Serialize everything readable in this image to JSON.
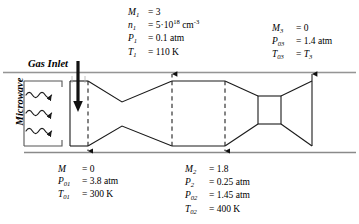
{
  "diagram": {
    "stroke_color": "#1a1a1a",
    "rail_color": "#7a7a7a",
    "dash_color": "#2b2b2b"
  },
  "labels": {
    "gas_inlet": "Gas Inlet",
    "microwave": "Microwave"
  },
  "stations": {
    "top_center": {
      "name": "station-1-conditions",
      "rows": [
        {
          "symbol": "M",
          "sub": "1",
          "sup": "",
          "eq": "=",
          "value": "3",
          "unit": ""
        },
        {
          "symbol": "n",
          "sub": "1",
          "sup": "",
          "eq": "=",
          "value": "5·10",
          "unit": "cm",
          "value_sup": "18",
          "unit_sup": "-3"
        },
        {
          "symbol": "P",
          "sub": "1",
          "sup": "",
          "eq": "=",
          "value": "0.1",
          "unit": "atm"
        },
        {
          "symbol": "T",
          "sub": "1",
          "sup": "",
          "eq": "=",
          "value": "110",
          "unit": "K"
        }
      ]
    },
    "top_right": {
      "name": "station-3-conditions",
      "rows": [
        {
          "symbol": "M",
          "sub": "3",
          "eq": "=",
          "value": "0",
          "unit": ""
        },
        {
          "symbol": "P",
          "sub": "03",
          "eq": "=",
          "value": "1.4",
          "unit": "atm"
        },
        {
          "symbol": "T",
          "sub": "03",
          "eq": "=",
          "value": "T",
          "value_sub": "3",
          "unit": ""
        }
      ]
    },
    "bottom_left": {
      "name": "station-0-conditions",
      "rows": [
        {
          "symbol": "M",
          "sub": "",
          "eq": "=",
          "value": "0",
          "unit": ""
        },
        {
          "symbol": "P",
          "sub": "01",
          "eq": "=",
          "value": "3.8",
          "unit": "atm"
        },
        {
          "symbol": "T",
          "sub": "01",
          "eq": "=",
          "value": "300",
          "unit": "K"
        }
      ]
    },
    "bottom_center": {
      "name": "station-2-conditions",
      "rows": [
        {
          "symbol": "M",
          "sub": "2",
          "eq": "=",
          "value": "1.8",
          "unit": ""
        },
        {
          "symbol": "P",
          "sub": "2",
          "eq": "=",
          "value": "0.25",
          "unit": "atm"
        },
        {
          "symbol": "P",
          "sub": "02",
          "eq": "=",
          "value": "1.45",
          "unit": "atm"
        },
        {
          "symbol": "T",
          "sub": "02",
          "eq": "=",
          "value": "400",
          "unit": "K"
        }
      ]
    }
  },
  "text": {
    "tc_m1_sym": "M",
    "tc_m1_sub": "1",
    "tc_m1_eq": "= 3",
    "tc_n1_sym": "n",
    "tc_n1_sub": "1",
    "tc_n1_eq": "= 5·10",
    "tc_n1_sup": "18",
    "tc_n1_unit": "cm",
    "tc_n1_unitsup": "-3",
    "tc_p1_sym": "P",
    "tc_p1_sub": "1",
    "tc_p1_eq": "= 0.1 atm",
    "tc_t1_sym": "T",
    "tc_t1_sub": "1",
    "tc_t1_eq": "= 110 K",
    "tr_m3_sym": "M",
    "tr_m3_sub": "3",
    "tr_m3_eq": "= 0",
    "tr_p03_sym": "P",
    "tr_p03_sub": "03",
    "tr_p03_eq": "= 1.4 atm",
    "tr_t03_sym": "T",
    "tr_t03_sub": "03",
    "tr_t03_eq": "=",
    "tr_t03_val": "T",
    "tr_t03_valsub": "3",
    "bl_m_sym": "M",
    "bl_m_eq": "= 0",
    "bl_p01_sym": "P",
    "bl_p01_sub": "01",
    "bl_p01_eq": "= 3.8 atm",
    "bl_t01_sym": "T",
    "bl_t01_sub": "01",
    "bl_t01_eq": "= 300 K",
    "bc_m2_sym": "M",
    "bc_m2_sub": "2",
    "bc_m2_eq": "= 1.8",
    "bc_p2_sym": "P",
    "bc_p2_sub": "2",
    "bc_p2_eq": "= 0.25 atm",
    "bc_p02_sym": "P",
    "bc_p02_sub": "02",
    "bc_p02_eq": "= 1.45 atm",
    "bc_t02_sym": "T",
    "bc_t02_sub": "02",
    "bc_t02_eq": "= 400 K"
  }
}
